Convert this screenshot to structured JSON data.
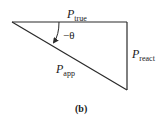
{
  "diagram": {
    "type": "power-triangle",
    "caption": "(b)",
    "sides": {
      "top": {
        "symbol": "P",
        "subscript": "true"
      },
      "right": {
        "symbol": "P",
        "subscript": "react"
      },
      "hypotenuse": {
        "symbol": "P",
        "subscript": "app"
      }
    },
    "angle": {
      "label": "−θ"
    },
    "colors": {
      "line": "#2a2a2a",
      "text": "#1a1a1a",
      "background": "#ffffff"
    }
  }
}
